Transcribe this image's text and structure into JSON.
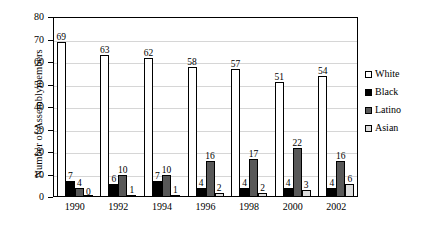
{
  "chart_data": {
    "type": "bar",
    "title": "",
    "xlabel": "",
    "ylabel": "Number of Assemblymembers",
    "ylim": [
      0,
      80
    ],
    "ytick_step": 10,
    "yticks": [
      "0",
      "10",
      "20",
      "30",
      "40",
      "50",
      "60",
      "70",
      "80"
    ],
    "grid": true,
    "legend_position": "right",
    "categories": [
      "1990",
      "1992",
      "1994",
      "1996",
      "1998",
      "2000",
      "2002"
    ],
    "series": [
      {
        "name": "White",
        "color": "#ffffff",
        "values": [
          69,
          63,
          62,
          58,
          57,
          51,
          54
        ]
      },
      {
        "name": "Black",
        "color": "#000000",
        "values": [
          7,
          6,
          7,
          4,
          4,
          4,
          4
        ]
      },
      {
        "name": "Latino",
        "color": "#585858",
        "values": [
          4,
          10,
          10,
          16,
          17,
          22,
          16
        ]
      },
      {
        "name": "Asian",
        "color": "#dcdcdc",
        "values": [
          0,
          1,
          1,
          2,
          2,
          3,
          6
        ]
      }
    ]
  },
  "legend": {
    "items": [
      {
        "label": "White",
        "swatch": "white"
      },
      {
        "label": "Black",
        "swatch": "black"
      },
      {
        "label": "Latino",
        "swatch": "latino"
      },
      {
        "label": "Asian",
        "swatch": "asian"
      }
    ]
  }
}
